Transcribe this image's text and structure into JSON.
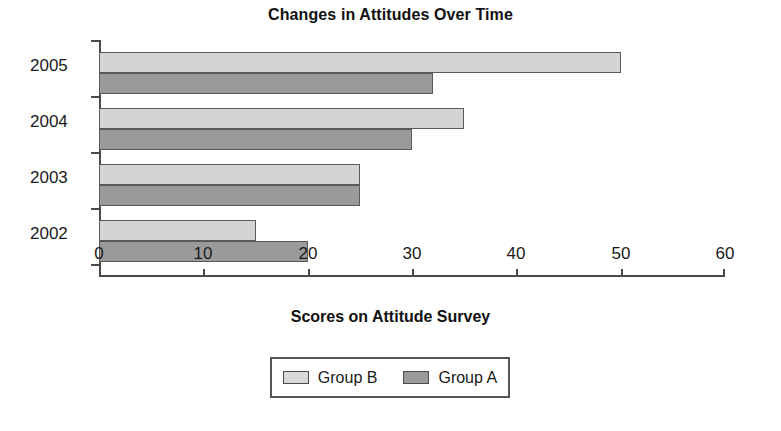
{
  "chart_data": {
    "type": "bar",
    "orientation": "horizontal",
    "title": "Changes in Attitudes Over Time",
    "xlabel": "Scores on Attitude Survey",
    "ylabel": "",
    "categories": [
      "2005",
      "2004",
      "2003",
      "2002"
    ],
    "series": [
      {
        "name": "Group B",
        "color": "#d4d4d4",
        "values": [
          50,
          35,
          25,
          15
        ]
      },
      {
        "name": "Group A",
        "color": "#9a9a9a",
        "values": [
          32,
          30,
          25,
          20
        ]
      }
    ],
    "xlim": [
      0,
      60
    ],
    "xticks": [
      0,
      10,
      20,
      30,
      40,
      50,
      60
    ],
    "xtick_labels": [
      "0",
      "10",
      "20",
      "30",
      "40",
      "50",
      "60"
    ],
    "grid": false,
    "legend_position": "bottom-center",
    "legend_entries": [
      "Group B",
      "Group A"
    ]
  },
  "axis": {
    "x_title": "Scores on Attitude Survey"
  }
}
